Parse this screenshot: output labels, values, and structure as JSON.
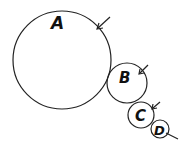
{
  "diagram": {
    "type": "tangent-circles",
    "circles": [
      {
        "label": "A",
        "cx": 62,
        "cy": 60,
        "r": 49
      },
      {
        "label": "B",
        "cx": 127,
        "cy": 83,
        "r": 20
      },
      {
        "label": "C",
        "cx": 141,
        "cy": 115,
        "r": 13
      },
      {
        "label": "D",
        "cx": 160,
        "cy": 129,
        "r": 9
      }
    ],
    "stroke_color": "#222222"
  }
}
